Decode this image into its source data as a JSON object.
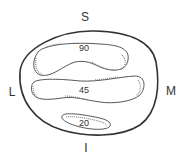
{
  "diagram": {
    "orientation_labels": {
      "superior": "S",
      "lateral": "L",
      "medial": "M",
      "inferior": "I"
    },
    "regions": [
      {
        "id": "upper",
        "value": "90"
      },
      {
        "id": "middle",
        "value": "45"
      },
      {
        "id": "lower",
        "value": "20"
      }
    ],
    "colors": {
      "outline": "#333333",
      "stipple": "#777777",
      "background": "#ffffff"
    }
  }
}
